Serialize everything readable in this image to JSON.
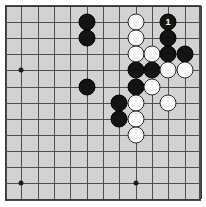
{
  "diagram": {
    "type": "go-board-diagram",
    "board_size": 13,
    "visible_region": "upper-right corner portion of a go board",
    "background_color": "#d2d2d2",
    "border_color": "#4a4a4a",
    "line_color": "#4f4f4f",
    "black_color": "#131313",
    "white_color": "#fbfbfb",
    "caption": ""
  },
  "grid": {
    "cols_x": [
      5,
      21,
      38,
      54,
      70,
      87,
      103,
      119,
      136,
      152,
      168,
      185,
      201
    ],
    "rows_y": [
      6,
      22,
      38,
      54,
      70,
      87,
      103,
      119,
      135,
      151,
      167,
      183,
      199
    ],
    "hoshi": [
      {
        "col": 1,
        "row": 4
      },
      {
        "col": 1,
        "row": 11
      },
      {
        "col": 8,
        "row": 11
      }
    ]
  },
  "stones": [
    {
      "color": "black",
      "col": 5,
      "row": 1,
      "label": ""
    },
    {
      "color": "black",
      "col": 5,
      "row": 2,
      "label": ""
    },
    {
      "color": "black",
      "col": 5,
      "row": 5,
      "label": ""
    },
    {
      "color": "white",
      "col": 8,
      "row": 1,
      "label": ""
    },
    {
      "color": "white",
      "col": 8,
      "row": 2,
      "label": ""
    },
    {
      "color": "white",
      "col": 8,
      "row": 3,
      "label": ""
    },
    {
      "color": "white",
      "col": 9,
      "row": 3,
      "label": ""
    },
    {
      "color": "black",
      "col": 10,
      "row": 1,
      "label": "1"
    },
    {
      "color": "black",
      "col": 10,
      "row": 2,
      "label": ""
    },
    {
      "color": "black",
      "col": 10,
      "row": 3,
      "label": ""
    },
    {
      "color": "black",
      "col": 11,
      "row": 3,
      "label": ""
    },
    {
      "color": "black",
      "col": 8,
      "row": 4,
      "label": ""
    },
    {
      "color": "black",
      "col": 9,
      "row": 4,
      "label": ""
    },
    {
      "color": "white",
      "col": 10,
      "row": 4,
      "label": ""
    },
    {
      "color": "white",
      "col": 11,
      "row": 4,
      "label": ""
    },
    {
      "color": "black",
      "col": 8,
      "row": 5,
      "label": ""
    },
    {
      "color": "white",
      "col": 9,
      "row": 5,
      "label": ""
    },
    {
      "color": "black",
      "col": 7,
      "row": 6,
      "label": ""
    },
    {
      "color": "white",
      "col": 8,
      "row": 6,
      "label": ""
    },
    {
      "color": "white",
      "col": 10,
      "row": 6,
      "label": ""
    },
    {
      "color": "black",
      "col": 7,
      "row": 7,
      "label": ""
    },
    {
      "color": "white",
      "col": 8,
      "row": 7,
      "label": ""
    },
    {
      "color": "white",
      "col": 8,
      "row": 8,
      "label": ""
    }
  ]
}
